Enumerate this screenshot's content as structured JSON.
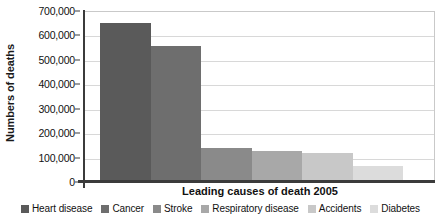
{
  "chart_data": {
    "type": "bar",
    "title": "",
    "xlabel": "Leading causes of death 2005",
    "ylabel": "Numbers of deaths",
    "categories": [
      "Heart disease",
      "Cancer",
      "Stroke",
      "Respiratory disease",
      "Accidents",
      "Diabetes"
    ],
    "values": [
      650000,
      556000,
      141000,
      125000,
      117000,
      66000
    ],
    "colors": [
      "#5a5a5a",
      "#6e6e6e",
      "#8a8a8a",
      "#a8a8a8",
      "#c8c8c8",
      "#dcdcdc"
    ],
    "ylim": [
      0,
      700000
    ],
    "ytick_labels": [
      "700,000",
      "600,000",
      "500,000",
      "400,000",
      "300,000",
      "200,000",
      "100,000",
      "0"
    ],
    "ytick_values": [
      700000,
      600000,
      500000,
      400000,
      300000,
      200000,
      100000,
      0
    ],
    "grid": true,
    "legend_position": "bottom",
    "legend": [
      {
        "label": "Heart disease",
        "color": "#5a5a5a"
      },
      {
        "label": "Cancer",
        "color": "#6e6e6e"
      },
      {
        "label": "Stroke",
        "color": "#8a8a8a"
      },
      {
        "label": "Respiratory disease",
        "color": "#a8a8a8"
      },
      {
        "label": "Accidents",
        "color": "#c8c8c8"
      },
      {
        "label": "Diabetes",
        "color": "#dcdcdc"
      }
    ]
  }
}
